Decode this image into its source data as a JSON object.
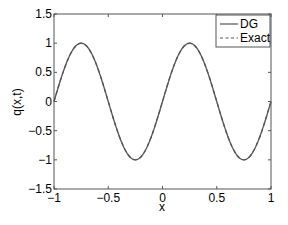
{
  "chart_data": {
    "type": "line",
    "title": "",
    "xlabel": "x",
    "ylabel": "q(x,t)",
    "xlim": [
      -1,
      1
    ],
    "ylim": [
      -1.5,
      1.5
    ],
    "grid": false,
    "legend_position": "upper right",
    "x_ticks": [
      -1,
      -0.5,
      0,
      0.5,
      1
    ],
    "x_tick_labels": [
      "−1",
      "−0.5",
      "0",
      "0.5",
      "1"
    ],
    "y_ticks": [
      1.5,
      1,
      0.5,
      0,
      -0.5,
      -1,
      -1.5
    ],
    "y_tick_labels": [
      "1.5",
      "1",
      "0.5",
      "0",
      "−0.5",
      "−1",
      "−1.5"
    ],
    "function": "q = sin(2*pi*x)",
    "x": [
      -1,
      -0.875,
      -0.75,
      -0.625,
      -0.5,
      -0.375,
      -0.25,
      -0.125,
      0,
      0.125,
      0.25,
      0.375,
      0.5,
      0.625,
      0.75,
      0.875,
      1
    ],
    "series": [
      {
        "name": "DG",
        "style": "solid",
        "color": "#555555",
        "values": [
          0,
          0.707,
          1,
          0.707,
          0,
          -0.707,
          -1,
          -0.707,
          0,
          0.707,
          1,
          0.707,
          0,
          -0.707,
          -1,
          -0.707,
          0
        ]
      },
      {
        "name": "Exact",
        "style": "dashed",
        "color": "#555555",
        "values": [
          0,
          0.707,
          1,
          0.707,
          0,
          -0.707,
          -1,
          -0.707,
          0,
          0.707,
          1,
          0.707,
          0,
          -0.707,
          -1,
          -0.707,
          0
        ]
      }
    ]
  },
  "legend": {
    "items": [
      {
        "label": "DG",
        "style": "solid"
      },
      {
        "label": "Exact",
        "style": "dashed"
      }
    ]
  },
  "colors": {
    "axis": "#555555",
    "line": "#555555"
  }
}
